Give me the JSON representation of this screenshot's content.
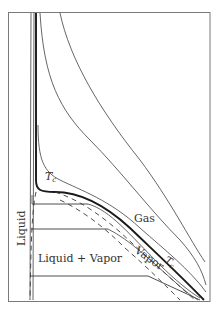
{
  "figure": {
    "type": "pressure-volume isotherm diagram",
    "labels": {
      "critical_temp_inner": "T",
      "critical_temp_inner_sub": "c",
      "critical_temp_outer": "T",
      "critical_temp_outer_sub": "c",
      "gas": "Gas",
      "vapor": "Vapor",
      "liquid": "Liquid",
      "liquid_vapor": "Liquid + Vapor"
    },
    "colors": {
      "frame": "#7a7a7a",
      "curves": "#555555",
      "critical_isotherm": "#1a1a1a",
      "text": "#333333"
    }
  }
}
